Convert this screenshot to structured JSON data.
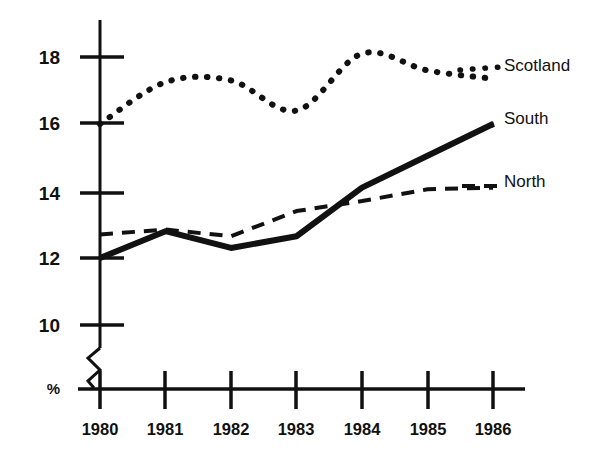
{
  "chart_data": {
    "type": "line",
    "title": "",
    "xlabel": "",
    "ylabel": "%",
    "categories": [
      "1980",
      "1981",
      "1982",
      "1983",
      "1984",
      "1985",
      "1986"
    ],
    "x": [
      1980,
      1981,
      1982,
      1983,
      1984,
      1985,
      1986
    ],
    "xlim": [
      1980,
      1986
    ],
    "ylim": [
      9.2,
      18.6
    ],
    "yticks": [
      10,
      12,
      14,
      16,
      18
    ],
    "ytick_labels": [
      "10",
      "12",
      "14",
      "16",
      "18"
    ],
    "grid": false,
    "axis_break": true,
    "legend_position": "right-inline",
    "series": [
      {
        "name": "Scotland",
        "style": "dotted",
        "color": "#111111",
        "values": [
          16.0,
          17.25,
          17.3,
          16.4,
          18.1,
          17.6,
          17.35
        ],
        "label_value": "Scotland"
      },
      {
        "name": "South",
        "style": "solid",
        "color": "#111111",
        "values": [
          12.0,
          12.8,
          12.3,
          12.65,
          14.1,
          15.05,
          16.0
        ],
        "label_value": "South"
      },
      {
        "name": "North",
        "style": "dashed",
        "color": "#111111",
        "values": [
          12.7,
          12.85,
          12.65,
          13.4,
          13.7,
          14.05,
          14.1
        ],
        "label_value": "North"
      }
    ]
  },
  "axes": {
    "y_unit_label": "%",
    "tick_labels_y": [
      "18",
      "16",
      "14",
      "12",
      "10"
    ],
    "tick_labels_x": [
      "1980",
      "1981",
      "1982",
      "1983",
      "1984",
      "1985",
      "1986"
    ]
  },
  "legend": {
    "scotland": "Scotland",
    "south": "South",
    "north": "North"
  },
  "title": {
    "text": ""
  },
  "colors": {
    "ink": "#111111",
    "background": "#ffffff"
  }
}
